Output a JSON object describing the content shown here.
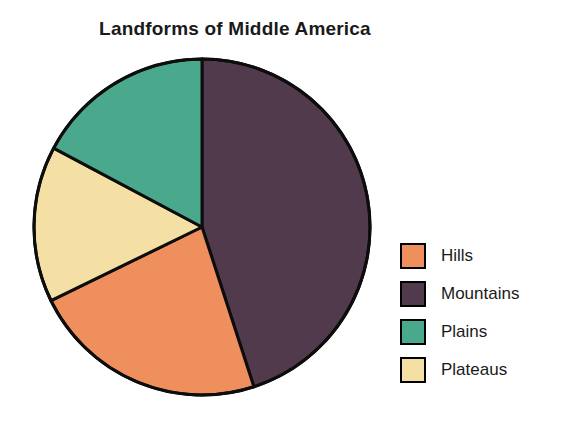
{
  "chart_data": {
    "type": "pie",
    "title": "Landforms of Middle America",
    "subtitle": "",
    "xlabel": "",
    "ylabel": "",
    "grid": false,
    "legend_position": "right",
    "start_angle_deg": 0,
    "direction": "clockwise",
    "categories": [
      "Mountains",
      "Hills",
      "Plateaus",
      "Plains"
    ],
    "values": [
      45,
      23,
      15,
      17
    ],
    "value_unit": "percent",
    "slices": [
      {
        "label": "Mountains",
        "value": 45,
        "angle_deg": 162,
        "color": "#503a4c"
      },
      {
        "label": "Hills",
        "value": 23,
        "angle_deg": 82,
        "color": "#ef8f5d"
      },
      {
        "label": "Plateaus",
        "value": 15,
        "angle_deg": 54,
        "color": "#f4e0a4"
      },
      {
        "label": "Plains",
        "value": 17,
        "angle_deg": 62,
        "color": "#4aa98c"
      }
    ],
    "outline_color": "#0d0d0d",
    "background": "#ffffff"
  },
  "legend": {
    "items": [
      {
        "label": "Hills",
        "color": "#ef8f5d"
      },
      {
        "label": "Mountains",
        "color": "#503a4c"
      },
      {
        "label": "Plains",
        "color": "#4aa98c"
      },
      {
        "label": "Plateaus",
        "color": "#f4e0a4"
      }
    ]
  }
}
